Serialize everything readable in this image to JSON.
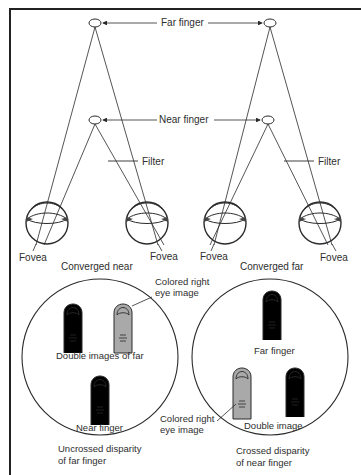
{
  "figure": {
    "top_diagram": {
      "labels": {
        "far_finger": "Far finger",
        "near_finger": "Near finger",
        "filter_left": "Filter",
        "filter_right": "Filter"
      },
      "left_panel": {
        "caption": "Converged near",
        "fovea_left": "Fovea",
        "fovea_right": "Fovea"
      },
      "right_panel": {
        "caption": "Converged far",
        "fovea_left": "Fovea",
        "fovea_right": "Fovea"
      }
    },
    "bottom_left_circle": {
      "callout_line1": "Colored right",
      "callout_line2": "eye image",
      "double_label": "Double images of far",
      "near_label": "Near finger",
      "caption_line1": "Uncrossed disparity",
      "caption_line2": "of far finger"
    },
    "bottom_right_circle": {
      "far_label": "Far finger",
      "double_label": "Double image",
      "callout_line1": "Colored right",
      "callout_line2": "eye image",
      "caption_line1": "Crossed disparity",
      "caption_line2": "of near finger"
    },
    "colors": {
      "line": "#2a2a2a",
      "colored_finger": "#a9a9a9",
      "background": "#ffffff"
    }
  }
}
